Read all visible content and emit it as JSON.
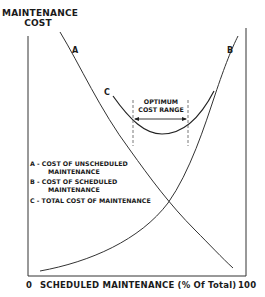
{
  "title": {
    "y_axis_line1": "MAINTENANCE",
    "y_axis_line2": "COST"
  },
  "x_axis": {
    "start_label": "0",
    "title": "SCHEDULED MAINTENANCE (% Of Total)",
    "end_label": "100"
  },
  "curves": {
    "a_label": "A",
    "b_label": "B",
    "c_label": "C"
  },
  "optimum": {
    "line1": "OPTIMUM",
    "line2": "COST RANGE"
  },
  "legend": {
    "a_line1": "A - COST OF UNSCHEDULED",
    "a_line2": "MAINTENANCE",
    "b_line1": "B - COST OF SCHEDULED",
    "b_line2": "MAINTENANCE",
    "c_line1": "C - TOTAL COST OF MAINTENANCE"
  },
  "colors": {
    "ink": "#1a1a1a",
    "background": "#ffffff"
  }
}
